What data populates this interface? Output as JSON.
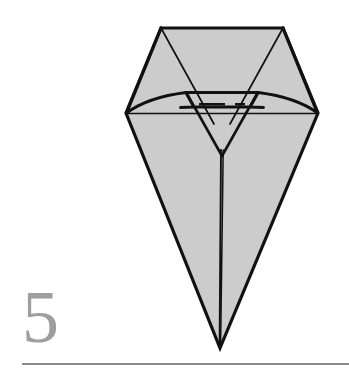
{
  "page": {
    "kind": "origami-instruction-step",
    "background_color": "#ffffff",
    "width": 349,
    "height": 381
  },
  "step": {
    "number": "5",
    "number_color": "#9e9e9e"
  },
  "rule": {
    "name": "bottom-divider-rule",
    "color": "#8a8a8a",
    "x_start": 22,
    "x_end": 349,
    "y": 364,
    "thickness": 2.2
  },
  "figure": {
    "fill_color": "#cccccc",
    "stroke_color": "#111111",
    "outline": [
      [
        161,
        28
      ],
      [
        283,
        28
      ],
      [
        318,
        113
      ],
      [
        220,
        348
      ],
      [
        126,
        113
      ]
    ],
    "creases": {
      "left_flap_diagonal": [
        [
          161,
          28
        ],
        [
          126,
          113
        ]
      ],
      "right_flap_diagonal": [
        [
          283,
          28
        ],
        [
          318,
          113
        ]
      ],
      "left_inner_diagonal": [
        [
          161,
          28
        ],
        [
          213,
          122
        ]
      ],
      "right_inner_diagonal": [
        [
          283,
          28
        ],
        [
          231,
          122
        ]
      ],
      "horizontal_band": [
        [
          126,
          113
        ],
        [
          318,
          113
        ]
      ],
      "left_wing_curve": [
        [
          126,
          113
        ],
        [
          157,
          99
        ],
        [
          186,
          93
        ]
      ],
      "right_wing_curve": [
        [
          318,
          113
        ],
        [
          287,
          99
        ],
        [
          258,
          93
        ]
      ],
      "center_trapezoid": [
        [
          186,
          93
        ],
        [
          258,
          93
        ],
        [
          249,
          107
        ],
        [
          195,
          107
        ]
      ],
      "left_notch": [
        [
          186,
          93
        ],
        [
          195,
          107
        ],
        [
          181,
          107
        ]
      ],
      "right_notch": [
        [
          258,
          93
        ],
        [
          249,
          107
        ],
        [
          263,
          107
        ]
      ],
      "inner_v": [
        [
          195,
          107
        ],
        [
          222,
          155
        ],
        [
          249,
          107
        ]
      ],
      "center_spine": [
        [
          222,
          155
        ],
        [
          220,
          348
        ]
      ],
      "dashed_center_line": [
        [
          199,
          104
        ],
        [
          245,
          104
        ]
      ]
    }
  },
  "icons": {
    "diagram": "origami-figure-icon"
  }
}
